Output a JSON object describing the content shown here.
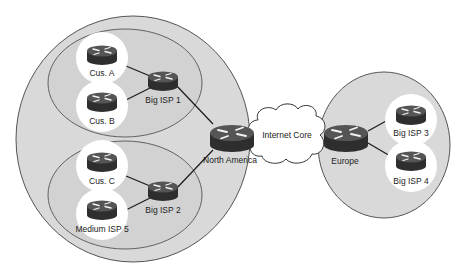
{
  "diagram": {
    "title": "",
    "regions": [
      {
        "id": "north-america-region",
        "label": ""
      },
      {
        "id": "isp1-region",
        "label": ""
      },
      {
        "id": "isp2-region",
        "label": ""
      },
      {
        "id": "europe-region",
        "label": ""
      }
    ],
    "cloud": {
      "label": "Internet Core"
    },
    "nodes": {
      "cus_a": {
        "label": "Cus. A",
        "icon": "router-icon"
      },
      "cus_b": {
        "label": "Cus. B",
        "icon": "router-icon"
      },
      "big_isp_1": {
        "label": "Big ISP 1",
        "icon": "router-icon"
      },
      "cus_c": {
        "label": "Cus. C",
        "icon": "router-icon"
      },
      "medium_isp_5": {
        "label": "Medium ISP 5",
        "icon": "router-icon"
      },
      "big_isp_2": {
        "label": "Big ISP 2",
        "icon": "router-icon"
      },
      "north_america": {
        "label": "North America",
        "icon": "router-icon"
      },
      "europe": {
        "label": "Europe",
        "icon": "router-icon"
      },
      "big_isp_3": {
        "label": "Big ISP 3",
        "icon": "router-icon"
      },
      "big_isp_4": {
        "label": "Big ISP 4",
        "icon": "router-icon"
      }
    },
    "links": [
      [
        "Cus. A",
        "Big ISP 1"
      ],
      [
        "Cus. B",
        "Big ISP 1"
      ],
      [
        "Big ISP 1",
        "North America"
      ],
      [
        "Cus. C",
        "Big ISP 2"
      ],
      [
        "Medium ISP 5",
        "Big ISP 2"
      ],
      [
        "Big ISP 2",
        "North America"
      ],
      [
        "North America",
        "Internet Core"
      ],
      [
        "Internet Core",
        "Europe"
      ],
      [
        "Europe",
        "Big ISP 3"
      ],
      [
        "Europe",
        "Big ISP 4"
      ]
    ],
    "colors": {
      "region_fill": "#d9d9d9",
      "region_stroke": "#555555",
      "router_body": "#3a3a3a",
      "router_top": "#5a5a5a",
      "node_halo": "#ffffff"
    }
  }
}
